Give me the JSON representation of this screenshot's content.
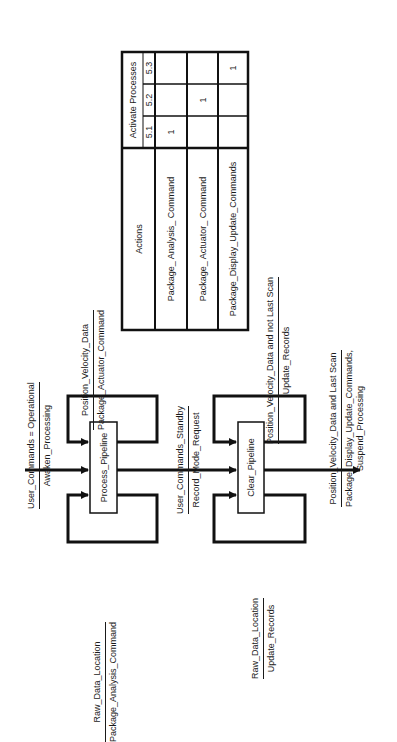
{
  "diagram": {
    "orientation": "rotated -90deg (reads bottom to top)",
    "states": [
      {
        "id": "process",
        "label": "Process_Pipeline"
      },
      {
        "id": "clear",
        "label": "Clear_Pipeline"
      }
    ],
    "transitions": {
      "entry": {
        "condition": "User_Commands = Operational",
        "action": "Awaken_Processing"
      },
      "process_self_upper": {
        "condition": "Position_Velocity_Data",
        "action": "Package_Actuator_Command"
      },
      "process_self_lower": {
        "condition": "Raw_Data_Location",
        "action": "Package_Analysis_Command"
      },
      "process_to_clear": {
        "condition": "User_Commands_Standby",
        "action": "Record_Mode_Request"
      },
      "clear_self_upper": {
        "condition": "Position_Velocity_Data and not Last Scan",
        "action": "Update_Records"
      },
      "clear_self_lower": {
        "condition": "Raw_Data_Location",
        "action": "Update_Records"
      },
      "exit": {
        "condition": "Position_Velocity_Data and Last Scan",
        "action": "Package_Display_Update_Commands,",
        "action2": "Suspend_Processing"
      }
    },
    "table": {
      "actions_header": "Actions",
      "group_header": "Activate Processes",
      "process_headers": [
        "5.1",
        "5.2",
        "5.3"
      ],
      "rows": [
        {
          "action": "Package_ Analysis_ Command",
          "values": [
            "1",
            "",
            ""
          ]
        },
        {
          "action": "Package_ Actuator_ Command",
          "values": [
            "",
            "1",
            ""
          ]
        },
        {
          "action": "Package_Display_Update_Commands",
          "values": [
            "",
            "",
            "1"
          ]
        }
      ]
    }
  }
}
